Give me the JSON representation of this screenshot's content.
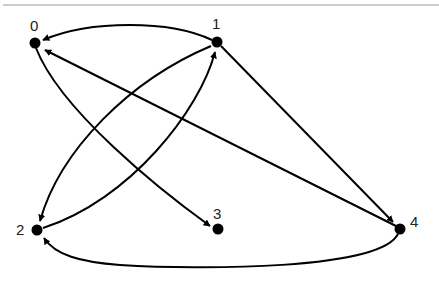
{
  "diagram": {
    "type": "directed-graph",
    "nodes": [
      {
        "id": "0",
        "label": "0",
        "x": 35,
        "y": 43
      },
      {
        "id": "1",
        "label": "1",
        "x": 217,
        "y": 42
      },
      {
        "id": "2",
        "label": "2",
        "x": 37,
        "y": 230
      },
      {
        "id": "3",
        "label": "3",
        "x": 218,
        "y": 229
      },
      {
        "id": "4",
        "label": "4",
        "x": 400,
        "y": 229
      }
    ],
    "edges": [
      {
        "from": "1",
        "to": "0",
        "shape": "curved"
      },
      {
        "from": "4",
        "to": "0",
        "shape": "straight"
      },
      {
        "from": "0",
        "to": "3",
        "shape": "curved"
      },
      {
        "from": "1",
        "to": "2",
        "shape": "curved"
      },
      {
        "from": "2",
        "to": "1",
        "shape": "curved"
      },
      {
        "from": "1",
        "to": "4",
        "shape": "straight"
      },
      {
        "from": "4",
        "to": "2",
        "shape": "curved"
      }
    ],
    "colors": {
      "node": "#000000",
      "edge": "#000000",
      "rule": "#999999"
    }
  }
}
